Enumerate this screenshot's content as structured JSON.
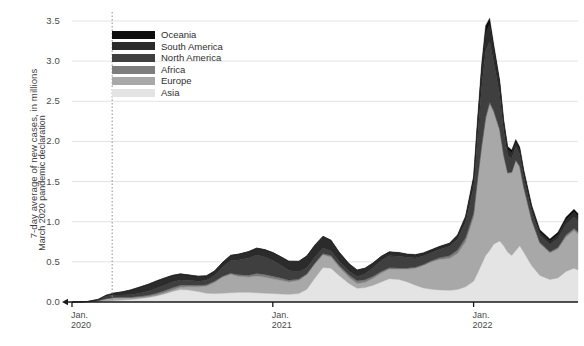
{
  "chart_data": {
    "type": "area",
    "stacked": true,
    "title": "",
    "subtitle": "",
    "xlabel": "",
    "ylabel": "7-day average of new cases, in millions",
    "ylim": [
      0,
      3.5
    ],
    "ytick_labels": [
      "0.0",
      "0.5",
      "1.0",
      "1.5",
      "2.0",
      "2.5",
      "3.0",
      "3.5"
    ],
    "ytick_values": [
      0,
      0.5,
      1.0,
      1.5,
      2.0,
      2.5,
      3.0,
      3.5
    ],
    "xtick_labels": [
      "Jan.\n2020",
      "Jan.\n2021",
      "Jan.\n2022"
    ],
    "xticks": [
      {
        "line1": "Jan.",
        "line2": "2020",
        "x": 2020.0
      },
      {
        "line1": "Jan.",
        "line2": "2021",
        "x": 2021.0
      },
      {
        "line1": "Jan.",
        "line2": "2022",
        "x": 2022.0
      }
    ],
    "xlim": [
      2020.0,
      2022.52
    ],
    "grid": "horizontal",
    "legend_position": "upper-left-inside",
    "annotations": [
      {
        "text": "March 2020 pandemic declaration",
        "x": 2020.2,
        "style": "dotted-vertical-line"
      }
    ],
    "series_order_bottom_to_top": [
      "Asia",
      "Europe",
      "Africa",
      "North America",
      "South America",
      "Oceania"
    ],
    "legend_order_top_to_bottom": [
      "Oceania",
      "South America",
      "North America",
      "Africa",
      "Europe",
      "Asia"
    ],
    "colors": {
      "Oceania": "#0d0d0d",
      "South America": "#2b2b2b",
      "North America": "#3f3f3f",
      "Africa": "#7d7d7d",
      "Europe": "#a8a8a8",
      "Asia": "#e4e4e4"
    },
    "x": [
      2020.0,
      2020.04,
      2020.08,
      2020.13,
      2020.17,
      2020.21,
      2020.25,
      2020.29,
      2020.33,
      2020.38,
      2020.42,
      2020.46,
      2020.5,
      2020.54,
      2020.58,
      2020.63,
      2020.67,
      2020.71,
      2020.75,
      2020.79,
      2020.83,
      2020.88,
      2020.92,
      2020.96,
      2021.0,
      2021.04,
      2021.08,
      2021.13,
      2021.17,
      2021.21,
      2021.25,
      2021.29,
      2021.33,
      2021.38,
      2021.42,
      2021.46,
      2021.5,
      2021.54,
      2021.58,
      2021.63,
      2021.67,
      2021.71,
      2021.75,
      2021.79,
      2021.83,
      2021.88,
      2021.92,
      2021.96,
      2022.0,
      2022.02,
      2022.04,
      2022.06,
      2022.08,
      2022.1,
      2022.13,
      2022.15,
      2022.17,
      2022.19,
      2022.21,
      2022.23,
      2022.25,
      2022.29,
      2022.33,
      2022.38,
      2022.42,
      2022.46,
      2022.5,
      2022.52
    ],
    "series": [
      {
        "name": "Asia",
        "values": [
          0.0,
          0.002,
          0.004,
          0.004,
          0.01,
          0.018,
          0.024,
          0.03,
          0.04,
          0.055,
          0.075,
          0.1,
          0.13,
          0.155,
          0.15,
          0.13,
          0.11,
          0.105,
          0.11,
          0.115,
          0.12,
          0.12,
          0.115,
          0.11,
          0.105,
          0.1,
          0.095,
          0.105,
          0.16,
          0.3,
          0.43,
          0.42,
          0.33,
          0.23,
          0.17,
          0.18,
          0.21,
          0.25,
          0.29,
          0.28,
          0.25,
          0.21,
          0.175,
          0.16,
          0.15,
          0.145,
          0.155,
          0.19,
          0.26,
          0.36,
          0.47,
          0.58,
          0.64,
          0.72,
          0.76,
          0.7,
          0.62,
          0.58,
          0.64,
          0.7,
          0.62,
          0.45,
          0.33,
          0.28,
          0.3,
          0.38,
          0.42,
          0.4
        ]
      },
      {
        "name": "Europe",
        "values": [
          0.0,
          0.0,
          0.001,
          0.01,
          0.03,
          0.035,
          0.028,
          0.02,
          0.015,
          0.012,
          0.012,
          0.015,
          0.02,
          0.028,
          0.04,
          0.06,
          0.09,
          0.14,
          0.2,
          0.23,
          0.2,
          0.19,
          0.21,
          0.2,
          0.185,
          0.17,
          0.155,
          0.165,
          0.18,
          0.175,
          0.16,
          0.14,
          0.105,
          0.075,
          0.06,
          0.065,
          0.085,
          0.11,
          0.12,
          0.13,
          0.16,
          0.21,
          0.28,
          0.34,
          0.38,
          0.4,
          0.45,
          0.56,
          0.8,
          1.15,
          1.45,
          1.7,
          1.83,
          1.65,
          1.38,
          1.12,
          0.98,
          1.03,
          1.12,
          0.98,
          0.8,
          0.56,
          0.4,
          0.33,
          0.36,
          0.43,
          0.47,
          0.45
        ]
      },
      {
        "name": "Africa",
        "values": [
          0.0,
          0.0,
          0.0,
          0.001,
          0.002,
          0.004,
          0.006,
          0.01,
          0.014,
          0.018,
          0.022,
          0.026,
          0.028,
          0.026,
          0.022,
          0.018,
          0.014,
          0.012,
          0.012,
          0.014,
          0.018,
          0.024,
          0.03,
          0.034,
          0.032,
          0.028,
          0.022,
          0.016,
          0.013,
          0.012,
          0.014,
          0.018,
          0.024,
          0.03,
          0.034,
          0.032,
          0.026,
          0.02,
          0.016,
          0.014,
          0.013,
          0.012,
          0.012,
          0.014,
          0.02,
          0.03,
          0.042,
          0.05,
          0.044,
          0.036,
          0.028,
          0.022,
          0.018,
          0.015,
          0.013,
          0.012,
          0.011,
          0.01,
          0.01,
          0.01,
          0.01,
          0.01,
          0.012,
          0.016,
          0.02,
          0.024,
          0.026,
          0.024
        ]
      },
      {
        "name": "North America",
        "values": [
          0.0,
          0.0,
          0.002,
          0.015,
          0.032,
          0.03,
          0.028,
          0.03,
          0.036,
          0.05,
          0.062,
          0.068,
          0.07,
          0.066,
          0.058,
          0.052,
          0.056,
          0.072,
          0.11,
          0.155,
          0.185,
          0.215,
          0.23,
          0.215,
          0.195,
          0.16,
          0.12,
          0.09,
          0.075,
          0.072,
          0.068,
          0.06,
          0.052,
          0.048,
          0.055,
          0.075,
          0.105,
          0.135,
          0.15,
          0.145,
          0.13,
          0.115,
          0.105,
          0.1,
          0.105,
          0.115,
          0.135,
          0.19,
          0.32,
          0.52,
          0.72,
          0.82,
          0.76,
          0.6,
          0.43,
          0.3,
          0.21,
          0.17,
          0.16,
          0.15,
          0.13,
          0.105,
          0.09,
          0.09,
          0.11,
          0.13,
          0.14,
          0.135
        ]
      },
      {
        "name": "South America",
        "values": [
          0.0,
          0.0,
          0.0,
          0.002,
          0.01,
          0.024,
          0.04,
          0.058,
          0.075,
          0.085,
          0.09,
          0.088,
          0.082,
          0.074,
          0.066,
          0.06,
          0.056,
          0.056,
          0.06,
          0.066,
          0.072,
          0.078,
          0.085,
          0.092,
          0.098,
          0.105,
          0.115,
          0.13,
          0.145,
          0.15,
          0.145,
          0.13,
          0.11,
          0.092,
          0.078,
          0.068,
          0.06,
          0.052,
          0.046,
          0.042,
          0.038,
          0.035,
          0.032,
          0.03,
          0.03,
          0.034,
          0.042,
          0.06,
          0.1,
          0.15,
          0.2,
          0.23,
          0.215,
          0.175,
          0.135,
          0.1,
          0.08,
          0.068,
          0.06,
          0.055,
          0.05,
          0.042,
          0.038,
          0.04,
          0.048,
          0.058,
          0.064,
          0.06
        ]
      },
      {
        "name": "Oceania",
        "values": [
          0.0,
          0.0,
          0.0,
          0.0,
          0.001,
          0.001,
          0.001,
          0.001,
          0.001,
          0.002,
          0.002,
          0.002,
          0.002,
          0.002,
          0.002,
          0.002,
          0.002,
          0.002,
          0.002,
          0.002,
          0.002,
          0.002,
          0.002,
          0.002,
          0.002,
          0.002,
          0.002,
          0.002,
          0.002,
          0.002,
          0.002,
          0.002,
          0.002,
          0.002,
          0.002,
          0.002,
          0.002,
          0.003,
          0.004,
          0.006,
          0.008,
          0.01,
          0.01,
          0.009,
          0.008,
          0.01,
          0.014,
          0.022,
          0.045,
          0.075,
          0.095,
          0.09,
          0.072,
          0.056,
          0.046,
          0.04,
          0.036,
          0.034,
          0.034,
          0.035,
          0.036,
          0.034,
          0.03,
          0.028,
          0.03,
          0.034,
          0.036,
          0.034
        ]
      }
    ],
    "peaks": [
      {
        "label": "Omicron peak",
        "x": 2022.08,
        "value": 3.4
      },
      {
        "label": "Omicron secondary peak",
        "x": 2022.21,
        "value": 1.9
      },
      {
        "label": "Spring 2021 peak",
        "x": 2021.29,
        "value": 0.9
      },
      {
        "label": "Winter 2020-21 peak",
        "x": 2020.92,
        "value": 0.77
      },
      {
        "label": "Delta 2021 peak",
        "x": 2021.58,
        "value": 0.63
      }
    ]
  },
  "legend": {
    "items": [
      {
        "label": "Oceania",
        "color": "#0d0d0d"
      },
      {
        "label": "South America",
        "color": "#2b2b2b"
      },
      {
        "label": "North America",
        "color": "#3f3f3f"
      },
      {
        "label": "Africa",
        "color": "#7d7d7d"
      },
      {
        "label": "Europe",
        "color": "#a8a8a8"
      },
      {
        "label": "Asia",
        "color": "#e4e4e4"
      }
    ]
  },
  "axes": {
    "y_title": "7-day average of new cases, in millions"
  },
  "annotation": {
    "text": "March 2020 pandemic declaration"
  }
}
